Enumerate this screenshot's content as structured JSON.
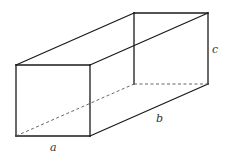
{
  "diagram": {
    "type": "rectangular-prism",
    "colors": {
      "edge": "#1a1a1a",
      "hidden_edge": "#555555",
      "label": "#333333",
      "background": "#ffffff"
    },
    "vertices": {
      "front_top_left": [
        16,
        65
      ],
      "front_top_right": [
        90,
        65
      ],
      "front_bottom_right": [
        90,
        136
      ],
      "front_bottom_left": [
        16,
        136
      ],
      "back_top_left": [
        134,
        13
      ],
      "back_top_right": [
        208,
        13
      ],
      "back_bottom_right": [
        208,
        84
      ],
      "back_bottom_left": [
        134,
        84
      ]
    },
    "labels": {
      "a": "a",
      "b": "b",
      "c": "c"
    }
  }
}
